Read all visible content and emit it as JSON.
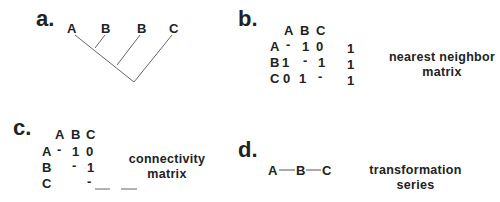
{
  "panels": {
    "a": {
      "label": "a.",
      "tree_leaves": [
        "A",
        "B",
        "B",
        "C"
      ]
    },
    "b": {
      "label": "b.",
      "col_headers": [
        "A",
        "B",
        "C"
      ],
      "rows": [
        {
          "header": "A",
          "cells": [
            "-",
            "1",
            "0"
          ],
          "extra": "1"
        },
        {
          "header": "B",
          "cells": [
            "1",
            "-",
            "1"
          ],
          "extra": "1"
        },
        {
          "header": "C",
          "cells": [
            "0",
            "1",
            "-"
          ],
          "extra": "1"
        }
      ],
      "caption_line1": "nearest neighbor",
      "caption_line2": "matrix"
    },
    "c": {
      "label": "c.",
      "col_headers": [
        "A",
        "B",
        "C"
      ],
      "rows": [
        {
          "header": "A",
          "cells": [
            "-",
            "1",
            "0"
          ]
        },
        {
          "header": "B",
          "cells": [
            "",
            "-",
            "1"
          ]
        },
        {
          "header": "C",
          "cells": [
            "",
            "",
            "-"
          ]
        }
      ],
      "caption_line1": "connectivity",
      "caption_line2": "matrix"
    },
    "d": {
      "label": "d.",
      "series": [
        "A",
        "B",
        "C"
      ],
      "caption_line1": "transformation",
      "caption_line2": "series"
    }
  }
}
